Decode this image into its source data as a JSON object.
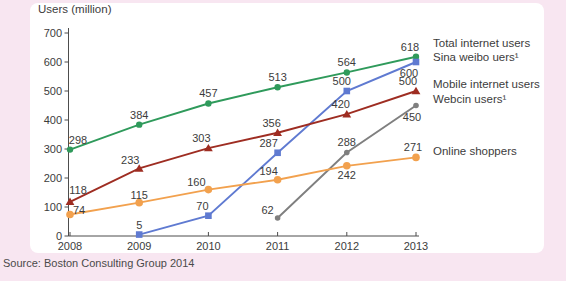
{
  "page": {
    "background": "#f8e6f1",
    "panel_background": "#ffffff"
  },
  "source_note": "Source: Boston Consulting Group 2014",
  "chart_data": {
    "type": "line",
    "title": "",
    "xlabel": "",
    "ylabel": "Users (million)",
    "ylim": [
      0,
      700
    ],
    "yticks": [
      0,
      100,
      200,
      300,
      400,
      500,
      600,
      700
    ],
    "categories": [
      "2008",
      "2009",
      "2010",
      "2011",
      "2012",
      "2013"
    ],
    "grid": false,
    "legend_position": "right",
    "text_color": "#3c3c3c",
    "axis_color": "#4d4d4d",
    "series": [
      {
        "name": "Total internet users",
        "color": "#2f9a5b",
        "marker": "circle",
        "values": [
          298,
          384,
          457,
          513,
          564,
          618
        ]
      },
      {
        "name": "Sina weibo uers¹",
        "color": "#5f7ad1",
        "marker": "square",
        "values": [
          null,
          5,
          70,
          287,
          500,
          600
        ]
      },
      {
        "name": "Mobile internet users",
        "color": "#9e2d22",
        "marker": "triangle",
        "values": [
          118,
          233,
          303,
          356,
          420,
          500
        ]
      },
      {
        "name": "Webcin users¹",
        "color": "#7f7f7f",
        "marker": "circle-small",
        "values": [
          null,
          null,
          null,
          62,
          288,
          450
        ]
      },
      {
        "name": "Online shoppers",
        "color": "#f2a14e",
        "marker": "circle",
        "values": [
          74,
          115,
          160,
          194,
          242,
          271
        ]
      }
    ]
  }
}
